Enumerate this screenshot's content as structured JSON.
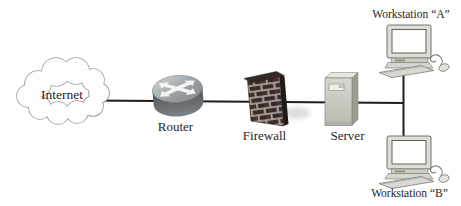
{
  "diagram": {
    "type": "network-topology",
    "nodes": [
      {
        "id": "internet",
        "label": "Internet",
        "kind": "cloud"
      },
      {
        "id": "router",
        "label": "Router",
        "kind": "router-cylinder"
      },
      {
        "id": "firewall",
        "label": "Firewall",
        "kind": "brick-wall"
      },
      {
        "id": "server",
        "label": "Server",
        "kind": "tower-server"
      },
      {
        "id": "workstation-a",
        "label": "Workstation “A”",
        "kind": "desktop-computer"
      },
      {
        "id": "workstation-b",
        "label": "Workstation “B”",
        "kind": "desktop-computer"
      }
    ],
    "connections": [
      {
        "from": "internet",
        "to": "router"
      },
      {
        "from": "router",
        "to": "firewall"
      },
      {
        "from": "firewall",
        "to": "server"
      },
      {
        "from": "server",
        "to": "workstation-a"
      },
      {
        "from": "server",
        "to": "workstation-b"
      }
    ],
    "colors": {
      "background": "#ffffff",
      "line": "#1e1e1e",
      "label_text": "#262626",
      "cloud_fill": "#fdfdfd",
      "cloud_outline": "#9a9a9a",
      "router_top": "#989ea2",
      "router_body": "#62686c",
      "router_arrows": "#f4f4f2",
      "firewall_brick": "#3e2b26",
      "firewall_mortar": "#a7a7a7",
      "server_body": "#c9c9c2",
      "workstation_body": "#d8d7d1"
    }
  }
}
